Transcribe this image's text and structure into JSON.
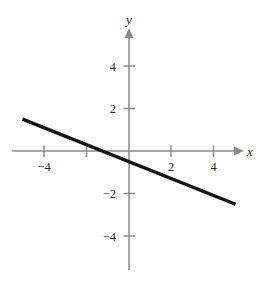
{
  "chart_data": {
    "type": "line",
    "title": "",
    "xlabel": "x",
    "ylabel": "y",
    "xlim": [
      -5.2,
      5.2
    ],
    "ylim": [
      -5.6,
      5.6
    ],
    "grid": false,
    "legend": null,
    "xticks": [
      -4,
      2,
      4
    ],
    "xtick_labels": [
      "−4",
      "2",
      "4"
    ],
    "yticks": [
      4,
      2,
      -2,
      -4
    ],
    "ytick_labels": [
      "4",
      "2",
      "−2",
      "−4"
    ],
    "series": [
      {
        "name": "line",
        "equation": "y = -0.4x - 0.5",
        "slope": -0.4,
        "intercept": -0.5,
        "x_intercept": -1.25,
        "x": [
          -5.0,
          5.0
        ],
        "y": [
          1.5,
          -2.5
        ],
        "color": "#141414",
        "line_width": 3.4
      }
    ],
    "axis_color": "#8a8a8a",
    "label_color": "#2b2b2b",
    "background": "#ffffff"
  },
  "axes": {
    "x_name": "x",
    "y_name": "y",
    "x_tick_labels": [
      "−4",
      "2",
      "4"
    ],
    "y_tick_labels": [
      "4",
      "2",
      "−2",
      "−4"
    ]
  },
  "geometry": {
    "origin_x": 129,
    "origin_y": 151,
    "unit_px": 21.3
  }
}
